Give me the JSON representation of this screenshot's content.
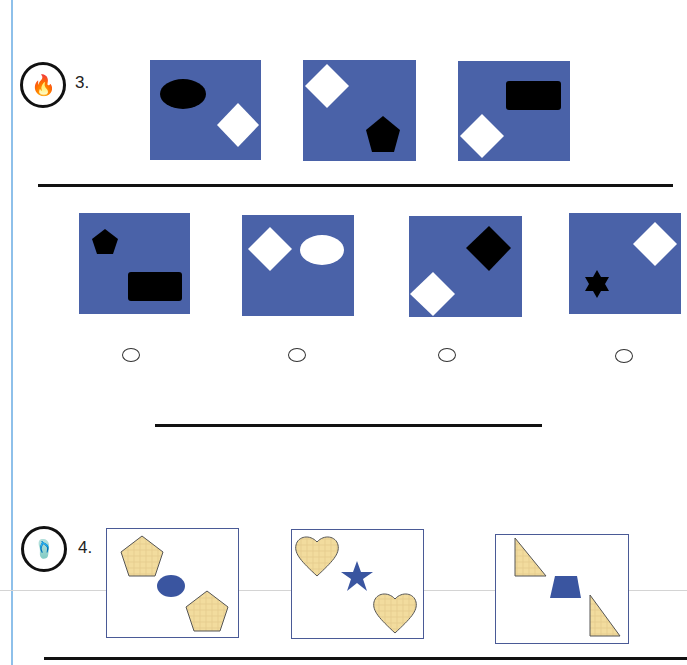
{
  "page": {
    "colors": {
      "panel_blue": "#4a62a8",
      "frame_border": "#4a5a96",
      "texture_fill": "#f2dc9e",
      "shape_dark": "#000000",
      "shape_light": "#ffffff",
      "shape_blue": "#3a55a0",
      "margin_line": "#8ec0ea"
    }
  },
  "questions": [
    {
      "number": "3.",
      "badge_icon": "campfire-icon",
      "badge_glyph": "🔥",
      "sequence": [
        {
          "shapes": [
            "black ellipse (top-left)",
            "white diamond (bottom-right)"
          ]
        },
        {
          "shapes": [
            "white diamond (top-left)",
            "black pentagon (bottom-right)"
          ]
        },
        {
          "shapes": [
            "black rectangle (top-right)",
            "white diamond (bottom-left)"
          ]
        }
      ],
      "options": [
        {
          "shapes": [
            "black pentagon (top-left)",
            "black rectangle (bottom-right)"
          ],
          "selected": false
        },
        {
          "shapes": [
            "white diamond (left)",
            "white ellipse (right)"
          ],
          "selected": false
        },
        {
          "shapes": [
            "black diamond (top-right)",
            "white diamond (bottom-left)"
          ],
          "selected": false
        },
        {
          "shapes": [
            "black six-point star (left)",
            "white diamond (top-right)"
          ],
          "selected": false
        }
      ],
      "answer_line": ""
    },
    {
      "number": "4.",
      "badge_icon": "flip-flops-icon",
      "badge_glyph": "🩴",
      "sequence": [
        {
          "shapes": [
            "textured pentagon (top-left)",
            "blue ellipse (center)",
            "textured pentagon (bottom-right)"
          ]
        },
        {
          "shapes": [
            "textured heart (top-left)",
            "blue star (center)",
            "textured heart (bottom-right)"
          ]
        },
        {
          "shapes": [
            "textured right triangle (top-left)",
            "blue trapezoid (center)",
            "textured right triangle (bottom-right)"
          ]
        }
      ]
    }
  ]
}
